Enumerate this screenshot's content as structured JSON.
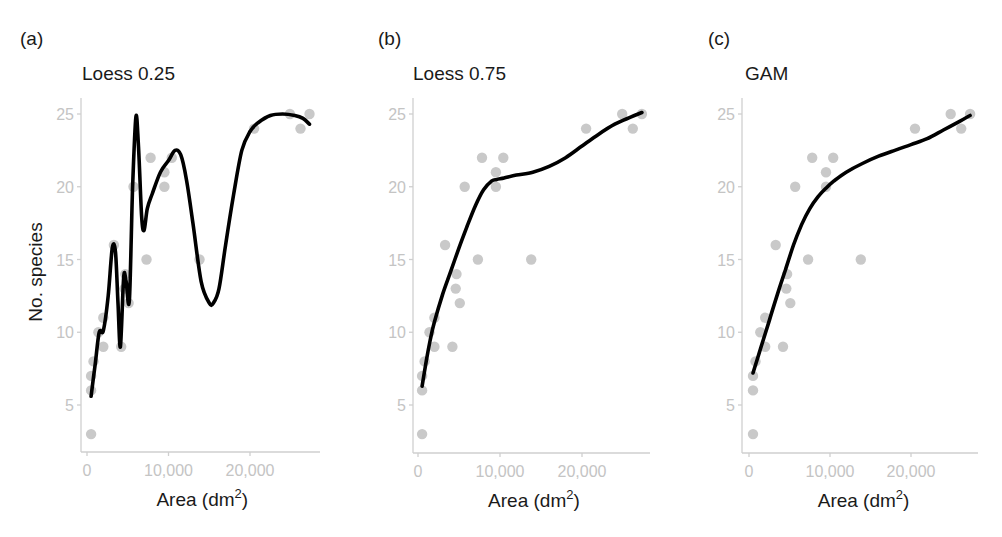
{
  "figure": {
    "ylabel": "No. species",
    "xlabel_base": "Area (dm",
    "xlabel_sup": "2",
    "xlabel_tail": ")"
  },
  "panels": [
    {
      "letter": "(a)",
      "title": "Loess 0.25"
    },
    {
      "letter": "(b)",
      "title": "Loess 0.75"
    },
    {
      "letter": "(c)",
      "title": "GAM"
    }
  ],
  "colors": {
    "points": "#c9c9c9",
    "curve": "#000000",
    "axis": "#cfcfcf",
    "tick_label": "#c4c4c4",
    "title": "#1a1a1a"
  },
  "chart_data": [
    {
      "type": "scatter",
      "title": "Loess 0.25",
      "panel": "(a)",
      "xlabel": "Area (dm²)",
      "ylabel": "No. species",
      "xticks": [
        0,
        10000,
        20000
      ],
      "xtick_labels": [
        "0",
        "10,000",
        "20,000"
      ],
      "yticks": [
        5,
        10,
        15,
        20,
        25
      ],
      "ytick_labels": [
        "5",
        "10",
        "15",
        "20",
        "25"
      ],
      "xlim": [
        -300,
        28500
      ],
      "ylim": [
        2.2,
        26
      ],
      "grid": false,
      "points": {
        "x": [
          500,
          500,
          500,
          800,
          2000,
          1400,
          2000,
          4200,
          3300,
          4700,
          4600,
          5100,
          5700,
          7300,
          7800,
          9500,
          9500,
          10400,
          13800,
          20500,
          24900,
          26200,
          27300
        ],
        "y": [
          3,
          6,
          7,
          8,
          9,
          10,
          11,
          9,
          16,
          14,
          13,
          12,
          20,
          15,
          22,
          21,
          20,
          22,
          15,
          24,
          25,
          24,
          25
        ]
      },
      "curve": {
        "name": "Loess span 0.25",
        "x": [
          500,
          1000,
          1500,
          2000,
          2600,
          3100,
          3500,
          3800,
          4100,
          4500,
          4800,
          5200,
          5600,
          6000,
          6300,
          6700,
          7000,
          7400,
          8000,
          9000,
          10000,
          10800,
          11500,
          12200,
          13000,
          14000,
          15000,
          15500,
          16200,
          17000,
          18000,
          19000,
          20000,
          21000,
          22500,
          24000,
          25500,
          26500,
          27300
        ],
        "y": [
          5.6,
          7.8,
          10.0,
          10.1,
          12.5,
          15.8,
          15.5,
          12.0,
          9.0,
          13.8,
          13.5,
          12.2,
          20.0,
          24.8,
          23.0,
          18.0,
          17.0,
          18.5,
          19.5,
          21.0,
          21.8,
          22.5,
          22.2,
          20.5,
          17.5,
          13.5,
          12.0,
          12.0,
          13.0,
          16.0,
          19.5,
          22.5,
          23.8,
          24.4,
          24.9,
          25.0,
          24.9,
          24.7,
          24.3
        ]
      }
    },
    {
      "type": "scatter",
      "title": "Loess 0.75",
      "panel": "(b)",
      "xlabel": "Area (dm²)",
      "ylabel": "",
      "xticks": [
        0,
        10000,
        20000
      ],
      "xtick_labels": [
        "0",
        "10,000",
        "20,000"
      ],
      "yticks": [
        5,
        10,
        15,
        20,
        25
      ],
      "ytick_labels": [
        "5",
        "10",
        "15",
        "20",
        "25"
      ],
      "xlim": [
        -300,
        28500
      ],
      "ylim": [
        2.2,
        26
      ],
      "grid": false,
      "points": {
        "x": [
          500,
          500,
          500,
          800,
          2000,
          1400,
          2000,
          4200,
          3300,
          4700,
          4600,
          5100,
          5700,
          7300,
          7800,
          9500,
          9500,
          10400,
          13800,
          20500,
          24900,
          26200,
          27300
        ],
        "y": [
          3,
          6,
          7,
          8,
          9,
          10,
          11,
          9,
          16,
          14,
          13,
          12,
          20,
          15,
          22,
          21,
          20,
          22,
          15,
          24,
          25,
          24,
          25
        ]
      },
      "curve": {
        "name": "Loess span 0.75",
        "x": [
          500,
          1000,
          1500,
          2000,
          3000,
          4000,
          5000,
          6000,
          7000,
          8000,
          9000,
          9600,
          10500,
          12000,
          14000,
          16000,
          18000,
          20000,
          22000,
          24000,
          26000,
          27300
        ],
        "y": [
          6.3,
          8.0,
          9.5,
          10.7,
          12.6,
          14.2,
          15.8,
          17.3,
          18.7,
          19.8,
          20.4,
          20.5,
          20.6,
          20.8,
          21.0,
          21.4,
          22.0,
          22.8,
          23.6,
          24.3,
          24.8,
          25.1
        ]
      }
    },
    {
      "type": "scatter",
      "title": "GAM",
      "panel": "(c)",
      "xlabel": "Area (dm²)",
      "ylabel": "",
      "xticks": [
        0,
        10000,
        20000
      ],
      "xtick_labels": [
        "0",
        "10,000",
        "20,000"
      ],
      "yticks": [
        5,
        10,
        15,
        20,
        25
      ],
      "ytick_labels": [
        "5",
        "10",
        "15",
        "20",
        "25"
      ],
      "xlim": [
        -300,
        28500
      ],
      "ylim": [
        2.2,
        26
      ],
      "grid": false,
      "points": {
        "x": [
          500,
          500,
          500,
          800,
          2000,
          1400,
          2000,
          4200,
          3300,
          4700,
          4600,
          5100,
          5700,
          7300,
          7800,
          9500,
          9500,
          10400,
          13800,
          20500,
          24900,
          26200,
          27300
        ],
        "y": [
          3,
          6,
          7,
          8,
          9,
          10,
          11,
          9,
          16,
          14,
          13,
          12,
          20,
          15,
          22,
          21,
          20,
          22,
          15,
          24,
          25,
          24,
          25
        ]
      },
      "curve": {
        "name": "GAM smooth",
        "x": [
          500,
          1500,
          2500,
          3500,
          4500,
          5500,
          6500,
          7500,
          8500,
          9500,
          10500,
          12000,
          14000,
          16000,
          18000,
          20000,
          22000,
          24000,
          26000,
          27300
        ],
        "y": [
          7.2,
          9.0,
          10.8,
          12.6,
          14.3,
          16.0,
          17.4,
          18.5,
          19.3,
          19.9,
          20.4,
          21.0,
          21.6,
          22.1,
          22.5,
          22.9,
          23.3,
          23.9,
          24.5,
          24.9
        ]
      }
    }
  ]
}
